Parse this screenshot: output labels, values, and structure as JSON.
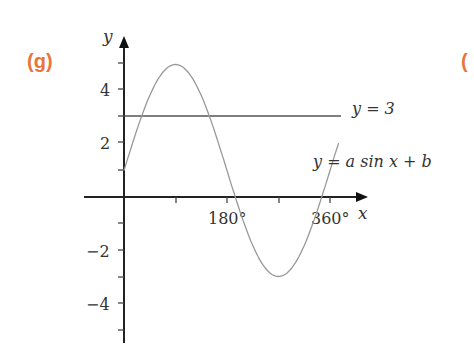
{
  "part_label": "(g)",
  "next_part_label_partial": "(",
  "chart_data": {
    "type": "line",
    "title": "",
    "xlabel": "x",
    "ylabel": "y",
    "x_ticks": [
      "180°",
      "360°"
    ],
    "y_ticks": [
      "4",
      "2",
      "−2",
      "−4"
    ],
    "xlim": [
      -30,
      420
    ],
    "ylim": [
      -5.6,
      5.8
    ],
    "grid": false,
    "series": [
      {
        "name": "y = a sin x + b",
        "equation": "y = 4 sin x + 1",
        "x": [
          0,
          30,
          60,
          90,
          120,
          150,
          180,
          210,
          240,
          270,
          300,
          330,
          360,
          375
        ],
        "values": [
          1,
          3,
          4.46,
          5,
          4.46,
          3,
          1,
          -1,
          -2.46,
          -3,
          -2.46,
          -1,
          1,
          2.04
        ]
      },
      {
        "name": "y = 3",
        "x": [
          0,
          385
        ],
        "values": [
          3,
          3
        ]
      }
    ],
    "annotations": [
      "y = 3",
      "y = a sin x + b"
    ]
  },
  "labels": {
    "y_axis": "y",
    "x_axis": "x",
    "tick_180": "180°",
    "tick_360": "360°",
    "tick_4": "4",
    "tick_2": "2",
    "tick_m2": "−2",
    "tick_m4": "−4",
    "line_label": "y = 3",
    "curve_label": "y = a sin x + b"
  }
}
